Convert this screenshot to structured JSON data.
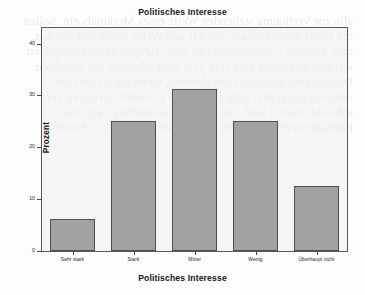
{
  "chart_data": {
    "type": "bar",
    "title": "Politisches Interesse",
    "xlabel": "Politisches Interesse",
    "ylabel": "Prozent",
    "categories": [
      "Sehr stark",
      "Stark",
      "Mittel",
      "Wenig",
      "Überhaupt nicht"
    ],
    "values": [
      6.2,
      25.0,
      31.2,
      25.0,
      12.5
    ],
    "ylim": [
      0,
      43
    ],
    "yticks": [
      0,
      10,
      20,
      30,
      40
    ],
    "ytick_labels": [
      "0",
      "10",
      "20",
      "30",
      "40"
    ],
    "grid": false,
    "legend": "none",
    "bar_color": "#a2a2a2",
    "bar_border_color": "#4f4f4f",
    "plot_background": "#eeeeee",
    "frame_color": "#5a5a5a"
  },
  "background_text": "alle zur Verfügung stehenden Werte eines Merkmals ein. Sollen die Werte einer Skala in der Art und Weise verdichtet werden, dass mehrere Ausprägungen zu einer Gruppe zusammengefasst werden, so erfolgt dies über eine Umkodierung der Variablen. Dies ist zum Beispiel dann sinnvoll, wenn die Anzahl der Ausprägungen sehr groß ist und die einzelnen Gruppen nur schwach besetzt sind. Die folgende Abbildung zeigt die Häufigkeitsverteilung des politischen Interesses in Prozent."
}
